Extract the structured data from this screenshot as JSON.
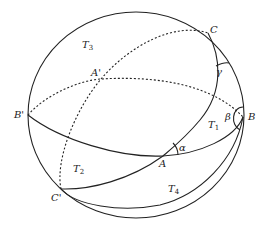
{
  "figure": {
    "points": {
      "A": "A",
      "A_prime": "A'",
      "B": "B",
      "B_prime": "B'",
      "C": "C",
      "C_prime": "C'"
    },
    "regions": {
      "T1": {
        "base": "T",
        "sub": "1"
      },
      "T2": {
        "base": "T",
        "sub": "2"
      },
      "T3": {
        "base": "T",
        "sub": "3"
      },
      "T4": {
        "base": "T",
        "sub": "4"
      }
    },
    "angles": {
      "alpha": "α",
      "beta": "β",
      "gamma": "γ"
    },
    "colors": {
      "stroke": "#222222",
      "background": "#ffffff"
    }
  }
}
